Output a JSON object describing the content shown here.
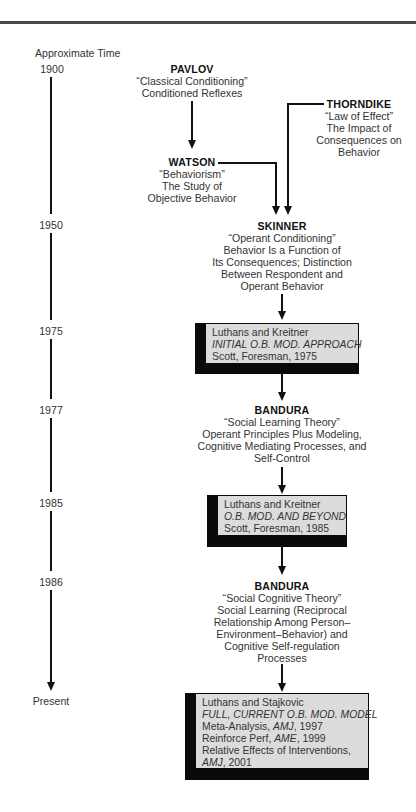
{
  "timeline": {
    "header": "Approximate Time",
    "ticks": [
      {
        "label": "1900",
        "y": 63
      },
      {
        "label": "1950",
        "y": 219
      },
      {
        "label": "1975",
        "y": 325
      },
      {
        "label": "1977",
        "y": 404
      },
      {
        "label": "1985",
        "y": 497
      },
      {
        "label": "1986",
        "y": 576
      },
      {
        "label": "Present",
        "y": 695
      }
    ]
  },
  "nodes": {
    "pavlov": {
      "name": "PAVLOV",
      "lines": [
        "“Classical Conditioning”",
        "Conditioned Reflexes"
      ]
    },
    "thorndike": {
      "name": "THORNDIKE",
      "lines": [
        "“Law of Effect”",
        "The Impact of",
        "Consequences on",
        "Behavior"
      ]
    },
    "watson": {
      "name": "WATSON",
      "lines": [
        "“Behaviorism”",
        "The Study of",
        "Objective Behavior"
      ]
    },
    "skinner": {
      "name": "SKINNER",
      "lines": [
        "“Operant Conditioning”",
        "Behavior Is a Function of",
        "Its Consequences; Distinction",
        "Between Respondent and",
        "Operant Behavior"
      ]
    },
    "bandura1977": {
      "name": "BANDURA",
      "lines": [
        "“Social Learning Theory”",
        "Operant Principles Plus Modeling,",
        "Cognitive Mediating Processes, and",
        "Self-Control"
      ]
    },
    "bandura1986": {
      "name": "BANDURA",
      "lines": [
        "“Social Cognitive Theory”",
        "Social Learning (Reciprocal",
        "Relationship Among Person–",
        "Environment–Behavior) and",
        "Cognitive Self-regulation",
        "Processes"
      ]
    }
  },
  "boxes": {
    "box1975": {
      "authors": "Luthans and Kreitner",
      "title": "INITIAL O.B. MOD. APPROACH",
      "pub": "Scott, Foresman, 1975"
    },
    "box1985": {
      "authors": "Luthans and Kreitner",
      "title": "O.B. MOD. AND BEYOND",
      "pub": "Scott, Foresman, 1985"
    },
    "box2001": {
      "authors": "Luthans and Stajkovic",
      "title": "FULL, CURRENT O.B. MOD. MODEL",
      "refs": [
        {
          "text": "Meta-Analysis, ",
          "journal": "AMJ",
          "year": ", 1997"
        },
        {
          "text": "Reinforce Perf, ",
          "journal": "AME",
          "year": ", 1999"
        },
        {
          "text": "Relative Effects of Interventions,",
          "journal": "",
          "year": ""
        },
        {
          "text": "",
          "journal": "AMJ",
          "year": ", 2001"
        }
      ]
    }
  },
  "colors": {
    "line": "#111111",
    "box_face": "#dcdcdc",
    "box_extrusion": "#0a0a0a",
    "rule": "#4a4a4a"
  }
}
